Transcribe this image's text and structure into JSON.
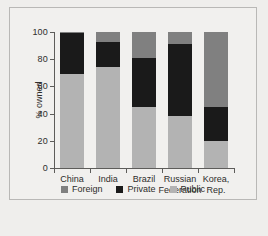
{
  "chart_data": {
    "type": "bar",
    "stacked": true,
    "title": "",
    "xlabel": "",
    "ylabel": "% owned",
    "ylim": [
      0,
      100
    ],
    "yticks": [
      0,
      20,
      40,
      60,
      80,
      100
    ],
    "ytick_labels": [
      "0",
      "20",
      "40",
      "60",
      "80",
      "100"
    ],
    "grid": false,
    "legend_position": "bottom",
    "categories": [
      "China",
      "India",
      "Brazil",
      "Russian\nFederation",
      "Korea,\nRep."
    ],
    "series": [
      {
        "name": "Public",
        "color": "#b3b3b3",
        "values": [
          69,
          74,
          45,
          38,
          20
        ]
      },
      {
        "name": "Private",
        "color": "#1a1a1a",
        "values": [
          30,
          19,
          36,
          53,
          25
        ]
      },
      {
        "name": "Foreign",
        "color": "#808080",
        "values": [
          1,
          7,
          19,
          9,
          55
        ]
      }
    ],
    "legend": [
      {
        "label": "Foreign",
        "color": "#808080"
      },
      {
        "label": "Private",
        "color": "#1a1a1a"
      },
      {
        "label": "Public",
        "color": "#b3b3b3"
      }
    ]
  }
}
